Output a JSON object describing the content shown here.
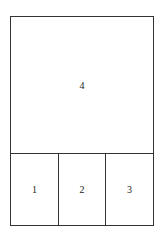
{
  "diagram": {
    "panels": [
      {
        "id": "top",
        "label": "4"
      },
      {
        "id": "bottom-left",
        "label": "1"
      },
      {
        "id": "bottom-middle",
        "label": "2"
      },
      {
        "id": "bottom-right",
        "label": "3"
      }
    ]
  }
}
